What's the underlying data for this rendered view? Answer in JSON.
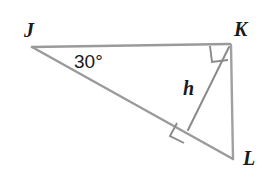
{
  "figure": {
    "kind": "right-triangle-with-altitude",
    "background_color": "#ffffff",
    "stroke_color_outline": "#9a9a9a",
    "stroke_color_altitude": "#8a8a8a",
    "text_color": "#1a1a1a"
  },
  "vertices": {
    "J": {
      "label": "J",
      "x": 32,
      "y": 47
    },
    "K": {
      "label": "K",
      "x": 230,
      "y": 44
    },
    "L": {
      "label": "L",
      "x": 233,
      "y": 159
    },
    "foot": {
      "label": "",
      "x": 188,
      "y": 130
    }
  },
  "sides": [
    {
      "name": "JK",
      "from": "J",
      "to": "K"
    },
    {
      "name": "KL",
      "from": "K",
      "to": "L"
    },
    {
      "name": "JL",
      "from": "J",
      "to": "L"
    }
  ],
  "altitude": {
    "name": "h",
    "label": "h",
    "from": "K",
    "to": "foot"
  },
  "angles": [
    {
      "at": "J",
      "label": "30°",
      "value": 30,
      "unit": "degrees"
    },
    {
      "at": "K",
      "label": "",
      "value": 90,
      "unit": "degrees",
      "marker": "right-angle-square"
    },
    {
      "at": "foot",
      "label": "",
      "value": 90,
      "unit": "degrees",
      "marker": "right-angle-square"
    }
  ]
}
